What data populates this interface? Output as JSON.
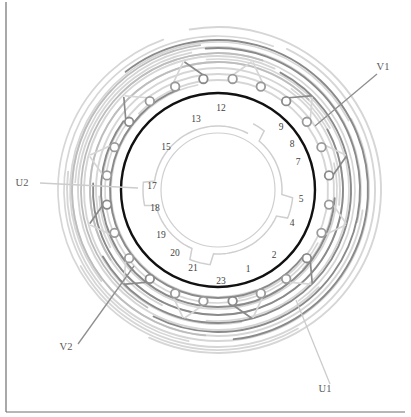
{
  "figure": {
    "kind": "stator-winding-diagram",
    "title": "",
    "canvas": {
      "width": 411,
      "height": 417
    }
  },
  "colors": {
    "bore_circle": "#111111",
    "arc_dark": "#8a8a8a",
    "arc_light": "#d6d6d6",
    "arc_mid": "#bdbdbd",
    "node_stroke": "#9a9a9a",
    "node_fill": "#ffffff",
    "inner_profile": "#cfcfcf",
    "leader_line": "#8f8f8f",
    "leader_line_light": "#cccccc",
    "frame_line": "#6f6f6f",
    "text": "#3f3f3f",
    "background": "#ffffff"
  },
  "geometry": {
    "center_x": 218,
    "center_y": 190,
    "bore_radius": 97,
    "bore_stroke_width": 2.4,
    "slot_number_radius": 86,
    "node_ring_radius": 112,
    "node_radius": 4.3,
    "inner_profile_radius": 64,
    "total_slots": 24
  },
  "frame": {
    "left_border": {
      "x": 6,
      "y_top": 2,
      "y_bottom": 412,
      "visible": true
    },
    "bottom_border": {
      "x_left": 6,
      "x_right": 405,
      "y": 412,
      "visible": true
    }
  },
  "slots": {
    "label_note": "Numbers printed inside the stator bore next to the black circle",
    "visible_numbers": [
      {
        "number": "1",
        "angle_deg": 70,
        "x": 248,
        "y": 272
      },
      {
        "number": "2",
        "angle_deg": 55,
        "x": 274,
        "y": 258
      },
      {
        "number": "4",
        "angle_deg": 32,
        "x": 292,
        "y": 226
      },
      {
        "number": "5",
        "angle_deg": 16,
        "x": 301,
        "y": 202
      },
      {
        "number": "7",
        "angle_deg": -16,
        "x": 298,
        "y": 165
      },
      {
        "number": "8",
        "angle_deg": -28,
        "x": 292,
        "y": 147
      },
      {
        "number": "9",
        "angle_deg": -40,
        "x": 281,
        "y": 130
      },
      {
        "number": "12",
        "angle_deg": -78,
        "x": 221,
        "y": 111
      },
      {
        "number": "13",
        "angle_deg": -92,
        "x": 196,
        "y": 122
      },
      {
        "number": "15",
        "angle_deg": -115,
        "x": 166,
        "y": 150
      },
      {
        "number": "17",
        "angle_deg": -160,
        "x": 152,
        "y": 189
      },
      {
        "number": "18",
        "angle_deg": 172,
        "x": 155,
        "y": 211
      },
      {
        "number": "19",
        "angle_deg": 158,
        "x": 161,
        "y": 238
      },
      {
        "number": "20",
        "angle_deg": 144,
        "x": 175,
        "y": 256
      },
      {
        "number": "21",
        "angle_deg": 128,
        "x": 193,
        "y": 271
      },
      {
        "number": "23",
        "angle_deg": 104,
        "x": 221,
        "y": 284
      }
    ]
  },
  "terminals": [
    {
      "id": "V1",
      "label": "V1",
      "text_x": 383,
      "text_y": 70,
      "leader": {
        "x1": 377,
        "y1": 74,
        "x2": 315,
        "y2": 126
      },
      "tone": "dark"
    },
    {
      "id": "U2",
      "label": "U2",
      "text_x": 22,
      "text_y": 186,
      "leader": {
        "x1": 40,
        "y1": 183,
        "x2": 138,
        "y2": 188
      },
      "tone": "light"
    },
    {
      "id": "V2",
      "label": "V2",
      "text_x": 66,
      "text_y": 350,
      "leader": {
        "x1": 78,
        "y1": 344,
        "x2": 134,
        "y2": 266
      },
      "tone": "dark"
    },
    {
      "id": "U1",
      "label": "U1",
      "text_x": 325,
      "text_y": 392,
      "leader": {
        "x1": 330,
        "y1": 384,
        "x2": 296,
        "y2": 300
      },
      "tone": "light"
    }
  ],
  "nodes": {
    "description": "Small open circles on the connection ring just outside the stator bore",
    "count": 24,
    "ring_radius": 112,
    "start_angle_deg": -97.5,
    "step_deg": 15
  },
  "end_windings": {
    "description": "Overlapping coil end arcs drawn in two gray tones",
    "dark_arc_count": 6,
    "light_arc_count": 10,
    "dark_radii": [
      150,
      142,
      133,
      125,
      117,
      108
    ],
    "light_radii": [
      163,
      157,
      151,
      146,
      140,
      134,
      128,
      122,
      116,
      110
    ]
  },
  "inner_profile": {
    "description": "Light gray rotor/tooth contour inside the bore with step notches",
    "radius": 64,
    "notch_count": 4
  }
}
